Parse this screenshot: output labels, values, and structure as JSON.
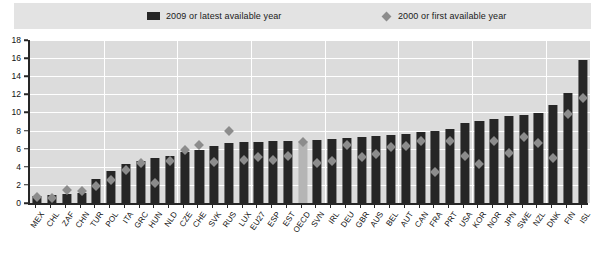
{
  "legend": {
    "series1_label": "2009 or latest available year",
    "series2_label": "2000 or first available year",
    "series1_icon": "filled-square-icon",
    "series2_icon": "filled-diamond-icon"
  },
  "colors": {
    "bar": "#262626",
    "bar_highlight": "#b5b5b5",
    "marker": "#8c8c8c",
    "plot_background": "#dcdcdc",
    "gridline": "#ffffff",
    "legend_background": "#e3e3e3",
    "axis": "#262626"
  },
  "chart_data": {
    "type": "bar",
    "title": "",
    "subtitle": "",
    "xlabel": "",
    "ylabel": "",
    "ylim": [
      0,
      18
    ],
    "ytick_step": 2,
    "yticks": [
      0,
      2,
      4,
      6,
      8,
      10,
      12,
      14,
      16,
      18
    ],
    "grid": true,
    "legend_position": "top",
    "highlight_category": "OECD",
    "categories": [
      "MEX",
      "CHL",
      "ZAF",
      "CHN",
      "TUR",
      "POL",
      "ITA",
      "GRC",
      "HUN",
      "NLD",
      "CZE",
      "CHE",
      "SVK",
      "RUS",
      "LUX",
      "EU27",
      "ESP",
      "EST",
      "OECD",
      "SVN",
      "IRL",
      "DEU",
      "GBR",
      "AUS",
      "BEL",
      "AUT",
      "CAN",
      "FRA",
      "PRT",
      "USA",
      "KOR",
      "NOR",
      "JPN",
      "SWE",
      "NZL",
      "DNK",
      "FIN",
      "ISL"
    ],
    "series": [
      {
        "name": "2009 or latest available year",
        "type": "bar",
        "values": [
          0.8,
          0.9,
          1.0,
          1.1,
          2.6,
          3.5,
          4.3,
          4.6,
          5.0,
          5.2,
          5.6,
          5.8,
          6.3,
          6.6,
          6.7,
          6.7,
          6.8,
          6.8,
          6.9,
          7.0,
          7.1,
          7.2,
          7.3,
          7.4,
          7.5,
          7.6,
          7.8,
          8.0,
          8.2,
          8.8,
          9.1,
          9.3,
          9.6,
          9.7,
          9.9,
          10.8,
          12.1,
          15.8
        ]
      },
      {
        "name": "2000 or first available year",
        "type": "scatter-diamond",
        "values": [
          0.7,
          0.6,
          1.4,
          1.3,
          1.9,
          2.5,
          3.7,
          4.4,
          2.2,
          4.6,
          5.8,
          6.4,
          4.5,
          7.9,
          4.7,
          5.1,
          4.8,
          5.2,
          6.7,
          4.4,
          4.6,
          6.4,
          5.1,
          5.4,
          6.2,
          6.3,
          6.8,
          3.4,
          6.8,
          5.2,
          4.3,
          6.8,
          5.5,
          7.3,
          6.6,
          5.0,
          9.8,
          11.6
        ]
      }
    ]
  }
}
